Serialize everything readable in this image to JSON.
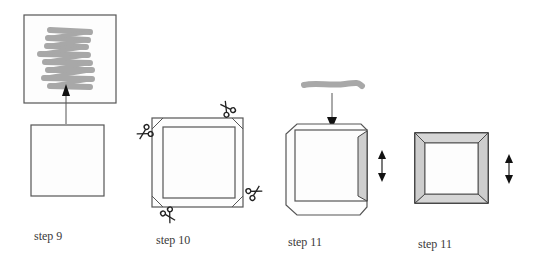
{
  "colors": {
    "line": "#555555",
    "dark_line": "#222222",
    "scribble": "#a8a8a8",
    "flap_fill": "#cfcfcf",
    "paper_fill": "#fdfdfd",
    "arrow": "#111111"
  },
  "steps": [
    {
      "label": "step 9",
      "description": "Paper square with scribbled pattern sheet placed above, arrow pointing up"
    },
    {
      "label": "step 10",
      "description": "Square placed on larger sheet, corners cut with scissors"
    },
    {
      "label": "step 11",
      "description": "Glue strip applied to top edge, right flap folded over, up-down arrow"
    },
    {
      "label": "step 11",
      "description": "All four edges folded to form bevelled frame, up-down arrow"
    }
  ],
  "icons": {
    "scissors": "scissors-icon",
    "arrow_up": "arrow-up-icon",
    "arrow_down": "arrow-down-icon",
    "double_arrow": "up-down-arrow-icon"
  }
}
